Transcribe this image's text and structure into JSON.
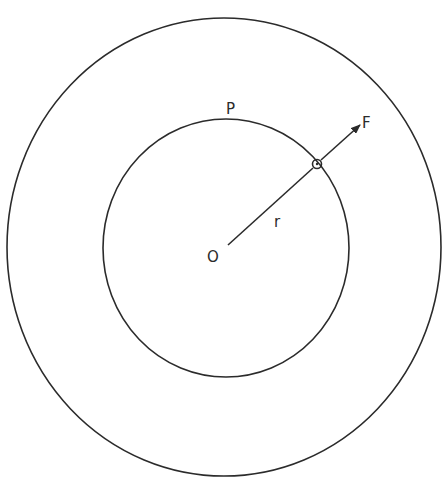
{
  "diagram": {
    "labels": {
      "center": "O",
      "radius": "r",
      "point": "P",
      "force": "F"
    },
    "colors": {
      "ink": "#2b2b2b",
      "background": "#ffffff"
    }
  }
}
